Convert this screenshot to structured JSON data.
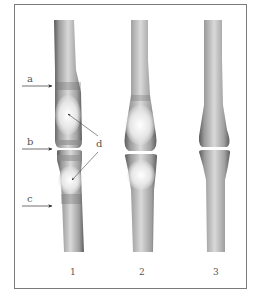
{
  "diagram": {
    "type": "anatomical-illustration",
    "frame_color": "#7a7a7a",
    "bones": [
      {
        "id": "1",
        "label": "1"
      },
      {
        "id": "2",
        "label": "2"
      },
      {
        "id": "3",
        "label": "3"
      }
    ],
    "markers": {
      "a": "a",
      "b": "b",
      "c": "c",
      "d": "d"
    },
    "colors": {
      "bone_dark": "#555555",
      "bone_mid": "#9a9a9a",
      "bone_light": "#f2f2f2",
      "annotation": "#555555"
    }
  }
}
